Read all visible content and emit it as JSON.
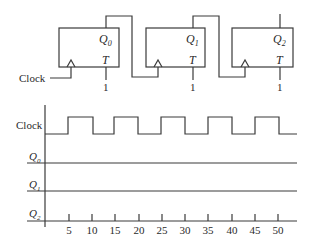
{
  "circuit": {
    "input_label": "Clock",
    "flipflops": [
      {
        "output": "Q",
        "sub": "0",
        "input": "T",
        "t_value": "1"
      },
      {
        "output": "Q",
        "sub": "1",
        "input": "T",
        "t_value": "1"
      },
      {
        "output": "Q",
        "sub": "2",
        "input": "T",
        "t_value": "1"
      }
    ]
  },
  "timing": {
    "signals": [
      {
        "name": "Clock",
        "sub": ""
      },
      {
        "name": "Q",
        "sub": "0"
      },
      {
        "name": "Q",
        "sub": "1"
      },
      {
        "name": "Q",
        "sub": "2"
      }
    ],
    "ticks": [
      "5",
      "10",
      "15",
      "20",
      "25",
      "30",
      "35",
      "40",
      "45",
      "50"
    ],
    "clock_high_intervals": [
      [
        5,
        10
      ],
      [
        15,
        20
      ],
      [
        25,
        30
      ],
      [
        35,
        40
      ],
      [
        45,
        50
      ]
    ]
  }
}
